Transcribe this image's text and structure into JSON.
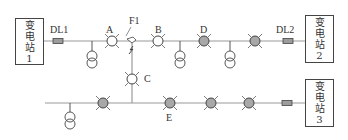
{
  "diagram": {
    "title": "",
    "stations": [
      {
        "id": "1",
        "chars": [
          "变",
          "电",
          "站",
          "1"
        ]
      },
      {
        "id": "2",
        "chars": [
          "变",
          "电",
          "站",
          "2"
        ]
      },
      {
        "id": "3",
        "chars": [
          "变",
          "电",
          "站",
          "3"
        ]
      }
    ],
    "breakers": [
      {
        "id": "DL1",
        "label": "DL1"
      },
      {
        "id": "DL2",
        "label": "DL2"
      },
      {
        "id": "DL3",
        "label": ""
      }
    ],
    "switches": [
      {
        "id": "A",
        "label": "A",
        "state": "open"
      },
      {
        "id": "B",
        "label": "B",
        "state": "open"
      },
      {
        "id": "D",
        "label": "D",
        "state": "closed"
      },
      {
        "id": "S4",
        "label": "",
        "state": "closed"
      },
      {
        "id": "C",
        "label": "C",
        "state": "open"
      },
      {
        "id": "S6",
        "label": "",
        "state": "closed"
      },
      {
        "id": "E",
        "label": "E",
        "state": "closed"
      },
      {
        "id": "S8",
        "label": "",
        "state": "closed"
      },
      {
        "id": "S9",
        "label": "",
        "state": "closed"
      }
    ],
    "fault": {
      "label": "F1"
    },
    "colors": {
      "line": "#9a9a9a",
      "closed_fill": "#a8a8a8",
      "open_fill": "#ffffff",
      "stroke": "#444444",
      "breaker_fill": "#9c9c9c"
    }
  }
}
